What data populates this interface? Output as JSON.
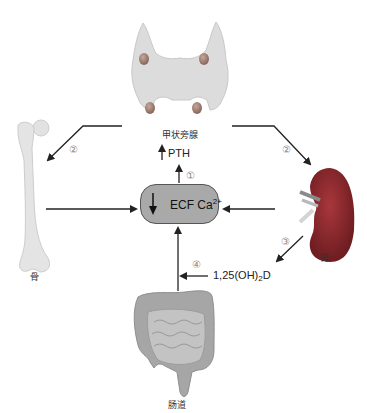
{
  "diagram": {
    "center_node": {
      "label": "ECF Ca",
      "superscript": "2+",
      "indicator": "down-arrow"
    },
    "organs": {
      "parathyroid": {
        "label": "甲状旁腺",
        "icon": "parathyroid-gland-image"
      },
      "bone": {
        "label": "骨",
        "icon": "femur-bone-image"
      },
      "kidney": {
        "label": "肾",
        "icon": "kidney-image"
      },
      "intestine": {
        "label": "肠道",
        "icon": "intestine-image"
      }
    },
    "hormones": {
      "pth": {
        "label": "PTH",
        "indicator": "up-arrow"
      },
      "vitd": {
        "prefix": "1,25(OH)",
        "subscript": "2",
        "suffix": "D"
      }
    },
    "step_markers": {
      "step1": "①",
      "step2_left": "②",
      "step2_right": "②",
      "step3": "③",
      "step4": "④"
    },
    "colors": {
      "node_fill": "#a9a9a9",
      "node_border": "#555555",
      "arrow": "#222222",
      "kidney": "#8e2a2e",
      "parathyroid": "#d8d8d8",
      "bone": "#e0e0e0",
      "intestine": "#9c9c9c"
    }
  }
}
